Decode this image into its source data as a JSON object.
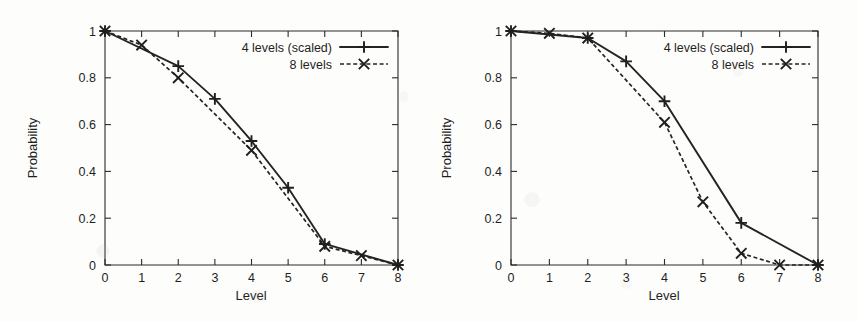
{
  "figure": {
    "background_color": "#fdfdfc",
    "ink_color": "#242424"
  },
  "chart_data": [
    {
      "type": "line",
      "panel": "left",
      "title": "",
      "xlabel": "Level",
      "ylabel": "Probability",
      "x": [
        0,
        1,
        2,
        3,
        4,
        5,
        6,
        7,
        8
      ],
      "xlim": [
        0,
        8
      ],
      "ylim": [
        0,
        1
      ],
      "xticks": [
        "0",
        "1",
        "2",
        "3",
        "4",
        "5",
        "6",
        "7",
        "8"
      ],
      "yticks": [
        "0",
        "0.2",
        "0.4",
        "0.6",
        "0.8",
        "1"
      ],
      "ytick_values": [
        0,
        0.2,
        0.4,
        0.6,
        0.8,
        1
      ],
      "grid": false,
      "legend_position": "top-right",
      "series": [
        {
          "name": "4 levels (scaled)",
          "line_style": "solid",
          "marker": "plus",
          "x": [
            0,
            2,
            3,
            4,
            5,
            6,
            8
          ],
          "values": [
            1.0,
            0.85,
            0.71,
            0.53,
            0.33,
            0.09,
            0.0
          ]
        },
        {
          "name": "8 levels",
          "line_style": "dashed",
          "marker": "cross",
          "x": [
            0,
            1,
            2,
            4,
            6,
            7,
            8
          ],
          "values": [
            1.0,
            0.94,
            0.8,
            0.49,
            0.08,
            0.04,
            0.0
          ]
        }
      ]
    },
    {
      "type": "line",
      "panel": "right",
      "title": "",
      "xlabel": "Level",
      "ylabel": "Probability",
      "x": [
        0,
        1,
        2,
        3,
        4,
        5,
        6,
        7,
        8
      ],
      "xlim": [
        0,
        8
      ],
      "ylim": [
        0,
        1
      ],
      "xticks": [
        "0",
        "1",
        "2",
        "3",
        "4",
        "5",
        "6",
        "7",
        "8"
      ],
      "yticks": [
        "0",
        "0.2",
        "0.4",
        "0.6",
        "0.8",
        "1"
      ],
      "ytick_values": [
        0,
        0.2,
        0.4,
        0.6,
        0.8,
        1
      ],
      "grid": false,
      "legend_position": "top-right",
      "series": [
        {
          "name": "4 levels (scaled)",
          "line_style": "solid",
          "marker": "plus",
          "x": [
            0,
            2,
            3,
            4,
            6,
            8
          ],
          "values": [
            1.0,
            0.97,
            0.87,
            0.7,
            0.18,
            0.0
          ]
        },
        {
          "name": "8 levels",
          "line_style": "dashed",
          "marker": "cross",
          "x": [
            0,
            1,
            2,
            4,
            5,
            6,
            7,
            8
          ],
          "values": [
            1.0,
            0.99,
            0.97,
            0.61,
            0.27,
            0.05,
            0.0,
            0.0
          ]
        }
      ]
    }
  ]
}
